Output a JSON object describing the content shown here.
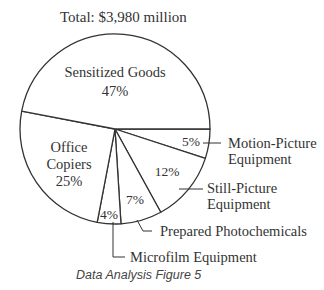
{
  "chart_data": {
    "type": "pie",
    "title": "Total:  $3,980 million",
    "total": "$3,980 million",
    "caption": "Data Analysis Figure 5",
    "start_angle_deg": 0,
    "direction": "clockwise",
    "slices": [
      {
        "name": "Motion-Picture Equipment",
        "label_lines": [
          "Motion-Picture",
          "Equipment"
        ],
        "value": 5,
        "pct_label": "5%"
      },
      {
        "name": "Still-Picture Equipment",
        "label_lines": [
          "Still-Picture",
          "Equipment"
        ],
        "value": 12,
        "pct_label": "12%"
      },
      {
        "name": "Prepared Photochemicals",
        "label_lines": [
          "Prepared Photochemicals"
        ],
        "value": 7,
        "pct_label": "7%"
      },
      {
        "name": "Microfilm Equipment",
        "label_lines": [
          "Microfilm Equipment"
        ],
        "value": 4,
        "pct_label": "4%"
      },
      {
        "name": "Office Copiers",
        "label_lines": [
          "Office",
          "Copiers"
        ],
        "value": 25,
        "pct_label": "25%"
      },
      {
        "name": "Sensitized Goods",
        "label_lines": [
          "Sensitized Goods"
        ],
        "value": 47,
        "pct_label": "47%"
      }
    ],
    "categories": [
      "Motion-Picture Equipment",
      "Still-Picture Equipment",
      "Prepared Photochemicals",
      "Microfilm Equipment",
      "Office Copiers",
      "Sensitized Goods"
    ],
    "values": [
      5,
      12,
      7,
      4,
      25,
      47
    ],
    "units": "percent",
    "legend": "none (external leader-line labels)"
  },
  "colors": {
    "stroke": "#333333",
    "fill": "#ffffff",
    "text": "#333333"
  }
}
